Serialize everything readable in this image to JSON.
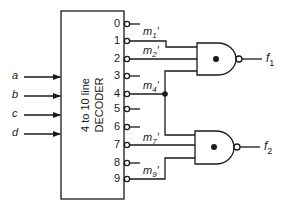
{
  "decoder": {
    "title_line1": "4 to 10 line",
    "title_line2": "DECODER",
    "inputs": [
      {
        "label": "a",
        "y": 77
      },
      {
        "label": "b",
        "y": 96
      },
      {
        "label": "c",
        "y": 115
      },
      {
        "label": "d",
        "y": 134
      }
    ],
    "outputs": [
      {
        "label": "0",
        "y": 24
      },
      {
        "label": "1",
        "y": 41
      },
      {
        "label": "2",
        "y": 59
      },
      {
        "label": "3",
        "y": 76
      },
      {
        "label": "4",
        "y": 94
      },
      {
        "label": "5",
        "y": 109
      },
      {
        "label": "6",
        "y": 127
      },
      {
        "label": "7",
        "y": 145
      },
      {
        "label": "8",
        "y": 163
      },
      {
        "label": "9",
        "y": 179
      }
    ]
  },
  "signals": [
    {
      "base": "m",
      "sub": "1",
      "prime": "′"
    },
    {
      "base": "m",
      "sub": "2",
      "prime": "′"
    },
    {
      "base": "m",
      "sub": "4",
      "prime": "′"
    },
    {
      "base": "m",
      "sub": "7",
      "prime": "′"
    },
    {
      "base": "m",
      "sub": "9",
      "prime": "′"
    }
  ],
  "gates": [
    {
      "type": "NAND",
      "output": {
        "base": "f",
        "sub": "1"
      },
      "inputs": [
        "m1'",
        "m2'",
        "m4'"
      ]
    },
    {
      "type": "NAND",
      "output": {
        "base": "f",
        "sub": "2"
      },
      "inputs": [
        "m4'",
        "m7'",
        "m9'"
      ]
    }
  ],
  "colors": {
    "stroke": "#1a1a1a",
    "background": "#ffffff"
  }
}
